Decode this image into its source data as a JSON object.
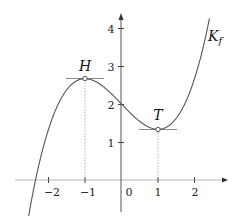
{
  "chart_data": {
    "type": "line",
    "title": "",
    "xlabel": "",
    "ylabel": "",
    "function": "f(x) = x^3/3 - x + 2",
    "series": [
      {
        "name": "K_f",
        "x": [
          -2.3,
          -2,
          -1.5,
          -1,
          -0.5,
          0,
          0.5,
          1,
          1.5,
          2,
          2.35
        ],
        "values": [
          0.24,
          1.33,
          2.38,
          2.67,
          2.46,
          2.0,
          1.54,
          1.33,
          1.63,
          2.67,
          4.0
        ]
      }
    ],
    "points": [
      {
        "label": "H",
        "x": -1,
        "y": 2.67,
        "type": "maximum",
        "tangent": "horizontal"
      },
      {
        "label": "T",
        "x": 1,
        "y": 1.33,
        "type": "minimum",
        "tangent": "horizontal"
      }
    ],
    "curve_label": "K_f",
    "x_ticks": [
      -2,
      -1,
      0,
      1,
      2
    ],
    "y_ticks": [
      1,
      2,
      3,
      4
    ],
    "xlim": [
      -2.9,
      2.8
    ],
    "ylim": [
      -0.6,
      4.5
    ],
    "grid": false,
    "legend": "none"
  },
  "labels": {
    "x_ticks": [
      "−2",
      "−1",
      "0",
      "1",
      "2"
    ],
    "y_ticks": [
      "1",
      "2",
      "3",
      "4"
    ],
    "H": "H",
    "T": "T",
    "curve_K": "K",
    "curve_sub": "f"
  }
}
